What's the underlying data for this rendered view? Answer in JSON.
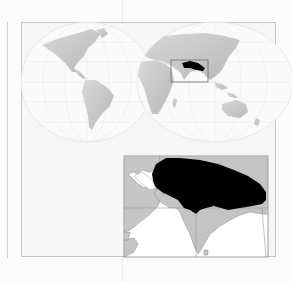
{
  "page": {
    "type": "species distribution map (scanned book page)",
    "background": "#fcfcfc"
  },
  "world_map": {
    "projection": "interrupted (two-lobe) globe",
    "hemispheres": [
      "Americas",
      "Europe-Africa-Asia-Australia"
    ],
    "land_color": "#c8c8c8",
    "graticule_color": "#ffffff",
    "locator_box": {
      "label": "Indian subcontinent locator",
      "stroke": "#6a6a6a"
    }
  },
  "inset_map": {
    "region": "South Asia (Indian subcontinent)",
    "land_color": "#c4c4c4",
    "sea_color": "#ffffff",
    "range_color": "#000000",
    "range_description": "Northern India / Himalayan foothills to Bengal",
    "frame_stroke": "#8a8a8a"
  },
  "legend": {
    "range": "Distribution range (black)"
  }
}
